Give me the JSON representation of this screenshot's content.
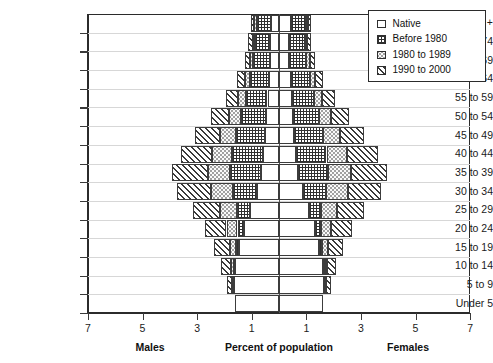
{
  "chart_data": {
    "type": "bar",
    "subtype": "population-pyramid-stacked",
    "title": "",
    "xlabel": "Percent of population",
    "ylabel": "",
    "left_side_label": "Males",
    "right_side_label": "Females",
    "xtick_labels": [
      "7",
      "5",
      "3",
      "1",
      "1",
      "3",
      "5",
      "7"
    ],
    "xtick_values": [
      -7,
      -5,
      -3,
      -1,
      1,
      3,
      5,
      7
    ],
    "xlim": [
      -7,
      7
    ],
    "grid": false,
    "legend_position": "top-right",
    "categories": [
      "75 +",
      "70 to 74",
      "65 to 69",
      "60 to 64",
      "55 to 59",
      "50 to 54",
      "45 to 49",
      "40 to 44",
      "35 to 39",
      "30 to 34",
      "25 to 29",
      "20 to 24",
      "15 to 19",
      "10 to 14",
      "5 to 9",
      "Under 5"
    ],
    "series": [
      {
        "name": "Native",
        "pattern": "plain",
        "swatch": "native-swatch"
      },
      {
        "name": "Before 1980",
        "pattern": "cross-hatch",
        "swatch": "before1980-swatch"
      },
      {
        "name": "1980 to 1989",
        "pattern": "stipple",
        "swatch": "y1980s-swatch"
      },
      {
        "name": "1990 to 2000",
        "pattern": "diagonal-hatch",
        "swatch": "y1990s-swatch"
      }
    ],
    "males": {
      "Native": [
        0.3,
        0.32,
        0.34,
        0.38,
        0.42,
        0.46,
        0.52,
        0.6,
        0.66,
        0.82,
        1.05,
        1.3,
        1.45,
        1.6,
        1.65,
        1.62
      ],
      "Before 1980": [
        0.52,
        0.55,
        0.6,
        0.68,
        0.8,
        0.95,
        1.05,
        1.12,
        1.12,
        0.88,
        0.48,
        0.22,
        0.12,
        0.06,
        0.04,
        0.0
      ],
      "1980 to 1989": [
        0.08,
        0.1,
        0.12,
        0.18,
        0.28,
        0.42,
        0.58,
        0.72,
        0.82,
        0.8,
        0.62,
        0.4,
        0.22,
        0.1,
        0.04,
        0.0
      ],
      "1990 to 2000": [
        0.12,
        0.16,
        0.2,
        0.3,
        0.46,
        0.68,
        0.92,
        1.16,
        1.32,
        1.22,
        1.0,
        0.8,
        0.58,
        0.36,
        0.18,
        0.0
      ]
    },
    "females": {
      "Native": [
        0.42,
        0.38,
        0.38,
        0.42,
        0.46,
        0.5,
        0.56,
        0.62,
        0.7,
        0.86,
        1.08,
        1.32,
        1.48,
        1.62,
        1.66,
        1.6
      ],
      "Before 1980": [
        0.58,
        0.58,
        0.62,
        0.7,
        0.82,
        0.96,
        1.06,
        1.12,
        1.1,
        0.86,
        0.46,
        0.2,
        0.1,
        0.05,
        0.03,
        0.0
      ],
      "1980 to 1989": [
        0.06,
        0.08,
        0.12,
        0.2,
        0.3,
        0.44,
        0.6,
        0.74,
        0.84,
        0.8,
        0.6,
        0.38,
        0.2,
        0.09,
        0.03,
        0.0
      ],
      "1990 to 2000": [
        0.1,
        0.14,
        0.2,
        0.3,
        0.46,
        0.66,
        0.9,
        1.14,
        1.3,
        1.2,
        0.98,
        0.78,
        0.56,
        0.34,
        0.17,
        0.0
      ]
    }
  },
  "legend": {
    "items": [
      {
        "label": "Native"
      },
      {
        "label": "Before 1980"
      },
      {
        "label": "1980 to 1989"
      },
      {
        "label": "1990 to 2000"
      }
    ]
  }
}
